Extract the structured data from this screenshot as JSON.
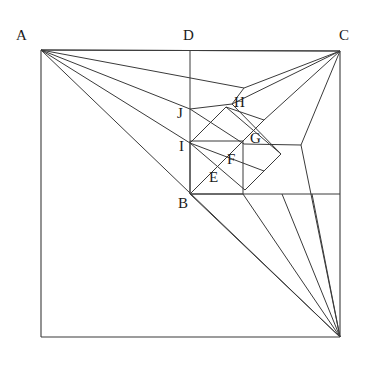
{
  "figure": {
    "stroke_color": "#3a3a3a",
    "label_color": "#1a1a1a",
    "background_color": "#ffffff",
    "canvas": {
      "width": 366,
      "height": 371
    }
  },
  "labels": [
    {
      "id": "A",
      "text": "A",
      "x": 16,
      "y": 28
    },
    {
      "id": "D",
      "text": "D",
      "x": 183,
      "y": 28
    },
    {
      "id": "C",
      "text": "C",
      "x": 339,
      "y": 28
    },
    {
      "id": "J",
      "text": "J",
      "x": 177,
      "y": 106
    },
    {
      "id": "H",
      "text": "H",
      "x": 234,
      "y": 95
    },
    {
      "id": "I",
      "text": "I",
      "x": 179,
      "y": 139
    },
    {
      "id": "G",
      "text": "G",
      "x": 250,
      "y": 131
    },
    {
      "id": "F",
      "text": "F",
      "x": 227,
      "y": 152
    },
    {
      "id": "E",
      "text": "E",
      "x": 209,
      "y": 170
    },
    {
      "id": "B",
      "text": "B",
      "x": 178,
      "y": 196
    }
  ],
  "points": {
    "A": {
      "x": 41,
      "y": 50
    },
    "C": {
      "x": 340,
      "y": 51
    },
    "P": {
      "x": 41,
      "y": 337
    },
    "Q": {
      "x": 340,
      "y": 337
    },
    "D": {
      "x": 190,
      "y": 50
    },
    "B": {
      "x": 190,
      "y": 194
    },
    "J": {
      "x": 190,
      "y": 109
    },
    "I": {
      "x": 190,
      "y": 143
    },
    "E": {
      "x": 213,
      "y": 171
    },
    "F": {
      "x": 230,
      "y": 154
    },
    "G": {
      "x": 247,
      "y": 137
    },
    "H": {
      "x": 232,
      "y": 104
    },
    "T1": {
      "x": 244,
      "y": 88
    },
    "R1": {
      "x": 243,
      "y": 194
    },
    "R2": {
      "x": 282,
      "y": 194
    },
    "R3": {
      "x": 312,
      "y": 194
    },
    "S1": {
      "x": 301,
      "y": 145
    },
    "S2": {
      "x": 264,
      "y": 120
    },
    "S3": {
      "x": 226,
      "y": 137
    },
    "S4": {
      "x": 207,
      "y": 120
    },
    "S5": {
      "x": 264,
      "y": 171
    },
    "S6": {
      "x": 281,
      "y": 154
    }
  },
  "segments": {
    "square_outline": [
      {
        "name": "top-edge",
        "x1": 41,
        "y1": 50,
        "x2": 340,
        "y2": 51
      },
      {
        "name": "right-edge",
        "x1": 340,
        "y1": 51,
        "x2": 340,
        "y2": 337
      },
      {
        "name": "bottom-edge",
        "x1": 340,
        "y1": 337,
        "x2": 41,
        "y2": 337
      },
      {
        "name": "left-edge",
        "x1": 41,
        "y1": 337,
        "x2": 41,
        "y2": 50
      }
    ],
    "median_lines": [
      {
        "name": "vertical-DB",
        "x1": 190,
        "y1": 50,
        "x2": 190,
        "y2": 194
      },
      {
        "name": "horizontal-B-right",
        "x1": 190,
        "y1": 194,
        "x2": 340,
        "y2": 194
      }
    ],
    "fan_from_A": [
      {
        "name": "A-to-C",
        "x1": 41,
        "y1": 50,
        "x2": 340,
        "y2": 51
      },
      {
        "name": "A-to-T1",
        "x1": 41,
        "y1": 50,
        "x2": 244,
        "y2": 88
      },
      {
        "name": "A-to-J",
        "x1": 41,
        "y1": 50,
        "x2": 190,
        "y2": 109
      },
      {
        "name": "A-to-I",
        "x1": 41,
        "y1": 50,
        "x2": 190,
        "y2": 143
      },
      {
        "name": "A-to-Q",
        "x1": 41,
        "y1": 50,
        "x2": 340,
        "y2": 337
      }
    ],
    "fan_from_C": [
      {
        "name": "C-to-T1",
        "x1": 340,
        "y1": 51,
        "x2": 244,
        "y2": 88
      },
      {
        "name": "C-to-H",
        "x1": 340,
        "y1": 51,
        "x2": 232,
        "y2": 104
      },
      {
        "name": "C-to-S1",
        "x1": 340,
        "y1": 51,
        "x2": 301,
        "y2": 145
      },
      {
        "name": "C-to-S2",
        "x1": 340,
        "y1": 51,
        "x2": 264,
        "y2": 120
      }
    ],
    "fan_from_Q": [
      {
        "name": "Q-to-B",
        "x1": 340,
        "y1": 337,
        "x2": 190,
        "y2": 194
      },
      {
        "name": "Q-to-R1",
        "x1": 340,
        "y1": 337,
        "x2": 243,
        "y2": 194
      },
      {
        "name": "Q-to-R2",
        "x1": 340,
        "y1": 337,
        "x2": 282,
        "y2": 194
      },
      {
        "name": "Q-to-R3",
        "x1": 340,
        "y1": 337,
        "x2": 312,
        "y2": 194
      },
      {
        "name": "Q-to-S1",
        "x1": 340,
        "y1": 337,
        "x2": 301,
        "y2": 145
      }
    ],
    "spiral_squares": [
      {
        "name": "sq1-a",
        "x1": 190,
        "y1": 194,
        "x2": 243,
        "y2": 194
      },
      {
        "name": "sq1-b",
        "x1": 243,
        "y1": 194,
        "x2": 243,
        "y2": 141
      },
      {
        "name": "sq1-c",
        "x1": 243,
        "y1": 141,
        "x2": 190,
        "y2": 141
      },
      {
        "name": "sq1-d",
        "x1": 190,
        "y1": 141,
        "x2": 190,
        "y2": 194
      },
      {
        "name": "diag-B-G",
        "x1": 190,
        "y1": 194,
        "x2": 264,
        "y2": 120
      },
      {
        "name": "diag-I-S5",
        "x1": 190,
        "y1": 143,
        "x2": 264,
        "y2": 171
      },
      {
        "name": "rot1-e1",
        "x1": 190,
        "y1": 143,
        "x2": 226,
        "y2": 107
      },
      {
        "name": "rot1-e2",
        "x1": 226,
        "y1": 107,
        "x2": 281,
        "y2": 154
      },
      {
        "name": "rot1-e3",
        "x1": 281,
        "y1": 154,
        "x2": 245,
        "y2": 190
      },
      {
        "name": "rot1-e4",
        "x1": 245,
        "y1": 190,
        "x2": 190,
        "y2": 143
      },
      {
        "name": "rot2-e1",
        "x1": 190,
        "y1": 109,
        "x2": 232,
        "y2": 104
      },
      {
        "name": "rot2-e2",
        "x1": 232,
        "y1": 104,
        "x2": 244,
        "y2": 88
      },
      {
        "name": "rot2-e3",
        "x1": 190,
        "y1": 109,
        "x2": 244,
        "y2": 144
      },
      {
        "name": "rot2-e4",
        "x1": 244,
        "y1": 144,
        "x2": 301,
        "y2": 145
      },
      {
        "name": "inner-d1",
        "x1": 226,
        "y1": 107,
        "x2": 264,
        "y2": 120
      },
      {
        "name": "inner-d2",
        "x1": 213,
        "y1": 171,
        "x2": 247,
        "y2": 137
      },
      {
        "name": "inner-d3",
        "x1": 232,
        "y1": 104,
        "x2": 281,
        "y2": 154
      }
    ]
  }
}
